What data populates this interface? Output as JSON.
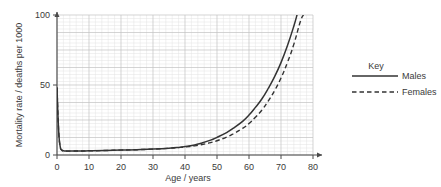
{
  "chart_data": {
    "type": "line",
    "title": "",
    "xlabel": "Age / years",
    "ylabel": "Mortality rate / deaths per 1000",
    "xlim": [
      0,
      80
    ],
    "ylim": [
      0,
      100
    ],
    "xticks": [
      0,
      10,
      20,
      30,
      40,
      50,
      60,
      70,
      80
    ],
    "yticks": [
      0,
      50,
      100
    ],
    "xtick_labels": [
      "0",
      "10",
      "20",
      "30",
      "40",
      "50",
      "60",
      "70",
      "80"
    ],
    "ytick_labels": [
      "0",
      "50",
      "100"
    ],
    "grid": true,
    "grid_minor_step_x": 2,
    "grid_minor_step_y": 2.5,
    "grid_major_step_x": 10,
    "grid_major_step_y": 12.5,
    "legend_position": "right",
    "legend_title": "Key",
    "line_color": "#333333",
    "grid_color": "#d9d9d9",
    "grid_major_color": "#bdbdbd",
    "axis_color": "#4a4a4a",
    "series": [
      {
        "name": "Males",
        "style": "solid",
        "x": [
          0,
          0.5,
          1,
          1.5,
          2,
          3,
          5,
          8,
          10,
          15,
          20,
          25,
          30,
          35,
          38,
          40,
          43,
          45,
          48,
          50,
          53,
          55,
          58,
          60,
          62,
          64,
          66,
          68,
          70,
          72,
          74,
          75
        ],
        "y": [
          48,
          18,
          6,
          3.6,
          3.0,
          2.8,
          2.8,
          2.9,
          3.0,
          3.2,
          3.5,
          3.8,
          4.2,
          4.8,
          5.4,
          6.0,
          7.2,
          8.4,
          10.6,
          12.6,
          16.0,
          19.0,
          24.0,
          28.5,
          34.0,
          40.0,
          47.5,
          56.0,
          66.0,
          78.0,
          92.0,
          100
        ]
      },
      {
        "name": "Females",
        "style": "dashed",
        "x": [
          0,
          0.5,
          1,
          1.5,
          2,
          3,
          5,
          8,
          10,
          15,
          20,
          25,
          30,
          35,
          38,
          40,
          43,
          45,
          48,
          50,
          53,
          55,
          58,
          60,
          62,
          64,
          66,
          68,
          70,
          72,
          74,
          76,
          77
        ],
        "y": [
          48,
          18,
          6,
          3.6,
          3.0,
          2.8,
          2.8,
          2.9,
          3.0,
          3.2,
          3.5,
          3.8,
          4.2,
          4.8,
          5.3,
          5.7,
          6.5,
          7.3,
          8.8,
          10.2,
          12.8,
          15.0,
          19.0,
          22.5,
          27.0,
          32.0,
          38.5,
          46.0,
          55.0,
          66.0,
          79.0,
          95.0,
          100
        ]
      }
    ],
    "annotations": []
  },
  "legend": {
    "title": "Key",
    "entries": [
      {
        "label": "Males",
        "style": "solid"
      },
      {
        "label": "Females",
        "style": "dashed"
      }
    ]
  },
  "axes": {
    "x_title": "Age / years",
    "y_title": "Mortality rate / deaths per 1000"
  }
}
